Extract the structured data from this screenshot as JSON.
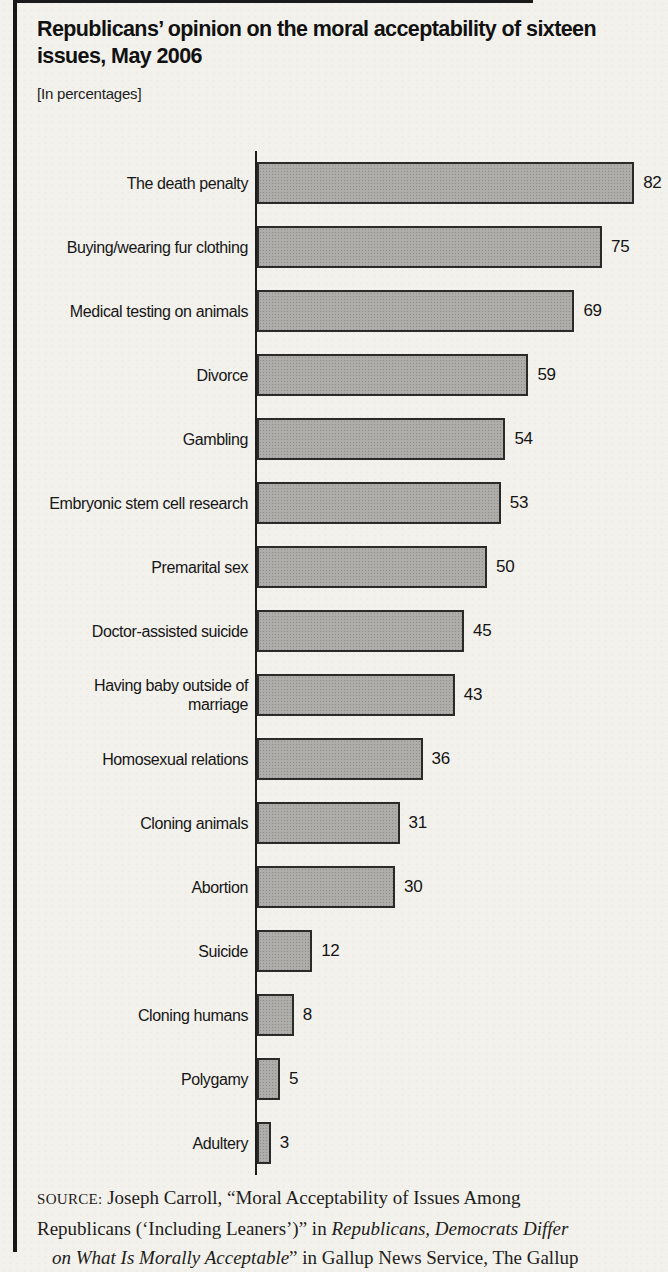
{
  "header": {
    "title_line1": "Republicans’ opinion on the moral acceptability of sixteen",
    "title_line2": "issues, May 2006",
    "units_note": "[In percentages]"
  },
  "chart_data": {
    "type": "bar",
    "orientation": "horizontal",
    "title": "Republicans’ opinion on the moral acceptability of sixteen issues, May 2006",
    "units": "percentages",
    "categories": [
      "The death penalty",
      "Buying/wearing fur clothing",
      "Medical testing on animals",
      "Divorce",
      "Gambling",
      "Embryonic stem cell research",
      "Premarital sex",
      "Doctor-assisted suicide",
      "Having baby outside of marriage",
      "Homosexual relations",
      "Cloning animals",
      "Abortion",
      "Suicide",
      "Cloning humans",
      "Polygamy",
      "Adultery"
    ],
    "values": [
      82,
      75,
      69,
      59,
      54,
      53,
      50,
      45,
      43,
      36,
      31,
      30,
      12,
      8,
      5,
      3
    ],
    "xlim": [
      0,
      90
    ],
    "grid": false,
    "legend": "none",
    "value_labels_shown": true,
    "bar_color": "#aeadaa",
    "bar_border_color": "#2a2a28",
    "axis_color": "#1c1c1c"
  },
  "source": {
    "label": "SOURCE:",
    "line1": " Joseph Carroll, “Moral Acceptability of Issues Among",
    "line2_roman": "Republicans (‘Including Leaners’)” in ",
    "line2_italic": "Republicans, Democrats Differ",
    "line3_italic": "on What Is Morally Acceptable",
    "line3_roman": "” in Gallup News Service, The Gallup"
  }
}
